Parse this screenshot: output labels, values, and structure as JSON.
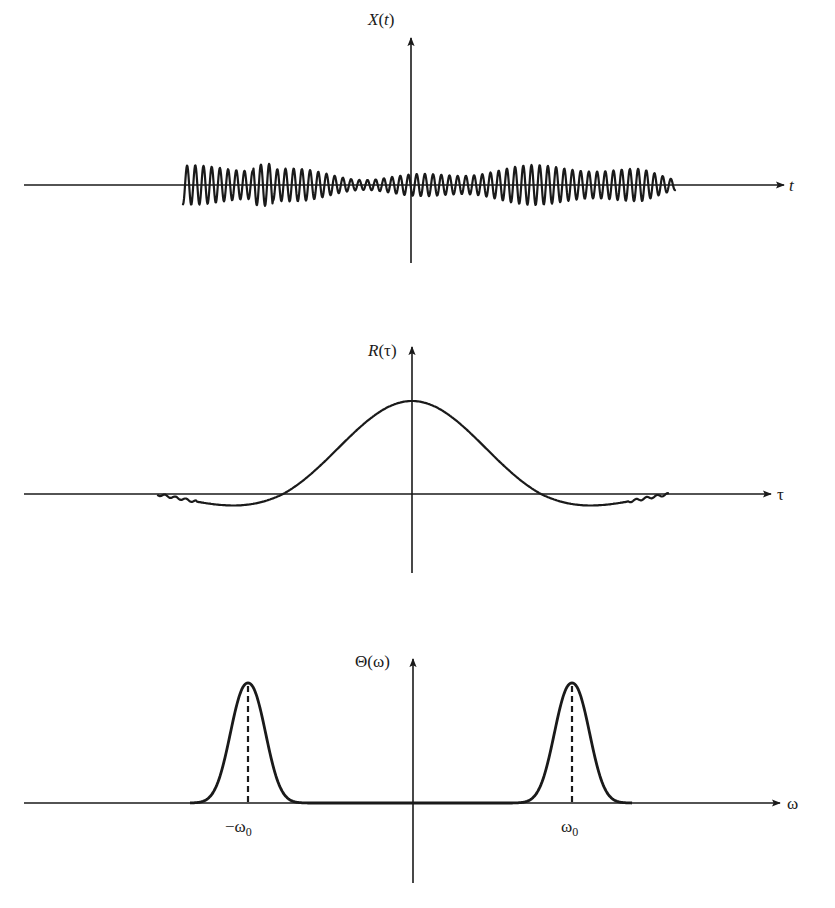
{
  "figure": {
    "panels": [
      {
        "id": "signal",
        "y_label_main": "X",
        "y_label_open": "(",
        "y_label_var": "t",
        "y_label_close": ")",
        "x_label": "t",
        "description": "Narrow-band random signal oscillating about zero"
      },
      {
        "id": "autocorrelation",
        "y_label_main": "R",
        "y_label_open": "(",
        "y_label_var": "τ",
        "y_label_close": ")",
        "x_label": "τ",
        "description": "Autocorrelation: broad central lobe with small negative side lobes"
      },
      {
        "id": "spectrum",
        "y_label_main": "Θ",
        "y_label_open": "(",
        "y_label_var": "ω",
        "y_label_close": ")",
        "x_label": "ω",
        "tick_left_main": "−ω",
        "tick_left_sub": "0",
        "tick_right_main": "ω",
        "tick_right_sub": "0",
        "description": "Spectral density: two narrow peaks at ±ω0"
      }
    ],
    "colors": {
      "ink": "#1a1a1a",
      "background": "#ffffff"
    }
  }
}
